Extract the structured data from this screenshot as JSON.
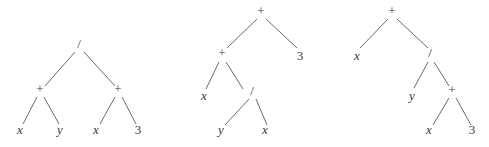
{
  "diagram": {
    "type": "expression-trees",
    "colors": {
      "edge": "#6a6a6a",
      "label": "#3a3a3a",
      "background": "#ffffff"
    },
    "trees": [
      {
        "id": "tree-1",
        "expression": "(x + y) / (x + 3)",
        "nodes": [
          {
            "id": "t1n0",
            "label": "/",
            "kind": "op",
            "x": 79,
            "y": 48
          },
          {
            "id": "t1n1",
            "label": "+",
            "kind": "op",
            "x": 40,
            "y": 93
          },
          {
            "id": "t1n2",
            "label": "+",
            "kind": "op",
            "x": 118,
            "y": 93
          },
          {
            "id": "t1n3",
            "label": "x",
            "kind": "var",
            "x": 20,
            "y": 134
          },
          {
            "id": "t1n4",
            "label": "y",
            "kind": "var",
            "x": 60,
            "y": 134
          },
          {
            "id": "t1n5",
            "label": "x",
            "kind": "var",
            "x": 96,
            "y": 134
          },
          {
            "id": "t1n6",
            "label": "3",
            "kind": "num",
            "x": 138,
            "y": 134
          }
        ],
        "edges": [
          {
            "from": [
              75,
              52
            ],
            "to": [
              45,
              86
            ]
          },
          {
            "from": [
              84,
              52
            ],
            "to": [
              115,
              86
            ]
          },
          {
            "from": [
              37,
              97
            ],
            "to": [
              23,
              124
            ]
          },
          {
            "from": [
              44,
              97
            ],
            "to": [
              59,
              124
            ]
          },
          {
            "from": [
              115,
              97
            ],
            "to": [
              100,
              124
            ]
          },
          {
            "from": [
              122,
              97
            ],
            "to": [
              136,
              124
            ]
          }
        ]
      },
      {
        "id": "tree-2",
        "expression": "(x + y / x) + 3",
        "nodes": [
          {
            "id": "t2n0",
            "label": "+",
            "kind": "op",
            "x": 261,
            "y": 15
          },
          {
            "id": "t2n1",
            "label": "+",
            "kind": "op",
            "x": 222,
            "y": 57
          },
          {
            "id": "t2n2",
            "label": "3",
            "kind": "num",
            "x": 300,
            "y": 60
          },
          {
            "id": "t2n3",
            "label": "x",
            "kind": "var",
            "x": 204,
            "y": 100
          },
          {
            "id": "t2n4",
            "label": "/",
            "kind": "op",
            "x": 252,
            "y": 95
          },
          {
            "id": "t2n5",
            "label": "y",
            "kind": "var",
            "x": 221,
            "y": 134
          },
          {
            "id": "t2n6",
            "label": "x",
            "kind": "var",
            "x": 265,
            "y": 134
          }
        ],
        "edges": [
          {
            "from": [
              257,
              19
            ],
            "to": [
              227,
              48
            ]
          },
          {
            "from": [
              266,
              19
            ],
            "to": [
              297,
              48
            ]
          },
          {
            "from": [
              219,
              62
            ],
            "to": [
              206,
              89
            ]
          },
          {
            "from": [
              226,
              62
            ],
            "to": [
              243,
              89
            ]
          },
          {
            "from": [
              249,
              99
            ],
            "to": [
              225,
              125
            ]
          },
          {
            "from": [
              256,
              99
            ],
            "to": [
              267,
              125
            ]
          }
        ]
      },
      {
        "id": "tree-3",
        "expression": "x + y / (x + 3)",
        "nodes": [
          {
            "id": "t3n0",
            "label": "+",
            "kind": "op",
            "x": 392,
            "y": 15
          },
          {
            "id": "t3n1",
            "label": "x",
            "kind": "var",
            "x": 357,
            "y": 60
          },
          {
            "id": "t3n2",
            "label": "/",
            "kind": "op",
            "x": 430,
            "y": 57
          },
          {
            "id": "t3n3",
            "label": "y",
            "kind": "var",
            "x": 412,
            "y": 100
          },
          {
            "id": "t3n4",
            "label": "+",
            "kind": "op",
            "x": 452,
            "y": 94
          },
          {
            "id": "t3n5",
            "label": "x",
            "kind": "var",
            "x": 429,
            "y": 134
          },
          {
            "id": "t3n6",
            "label": "3",
            "kind": "num",
            "x": 472,
            "y": 134
          }
        ],
        "edges": [
          {
            "from": [
              388,
              19
            ],
            "to": [
              360,
              48
            ]
          },
          {
            "from": [
              397,
              19
            ],
            "to": [
              428,
              48
            ]
          },
          {
            "from": [
              428,
              62
            ],
            "to": [
              414,
              88
            ]
          },
          {
            "from": [
              434,
              62
            ],
            "to": [
              449,
              86
            ]
          },
          {
            "from": [
              449,
              98
            ],
            "to": [
              433,
              125
            ]
          },
          {
            "from": [
              456,
              98
            ],
            "to": [
              471,
              125
            ]
          }
        ]
      }
    ]
  }
}
